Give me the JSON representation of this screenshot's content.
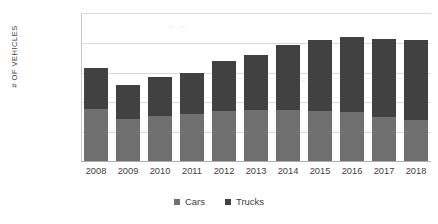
{
  "chart_data": {
    "type": "bar",
    "subtype": "stacked-vertical",
    "title": "",
    "xlabel": "",
    "ylabel": "# OF VEHICLES",
    "categories": [
      "2008",
      "2009",
      "2010",
      "2011",
      "2012",
      "2013",
      "2014",
      "2015",
      "2016",
      "2017",
      "2018"
    ],
    "series": [
      {
        "name": "Cars",
        "color": "#707070",
        "values": [
          8900000,
          7300000,
          7700000,
          8100000,
          8600000,
          8800000,
          8800000,
          8600000,
          8400000,
          7600000,
          7100000
        ]
      },
      {
        "name": "Trucks",
        "color": "#414141",
        "values": [
          6800000,
          5600000,
          6500000,
          6900000,
          8400000,
          9200000,
          10800000,
          11900000,
          12500000,
          13000000,
          13400000
        ]
      }
    ],
    "totals": [
      15700000,
      12900000,
      14200000,
      15000000,
      17000000,
      18000000,
      19600000,
      20500000,
      20900000,
      20600000,
      20500000
    ],
    "ylim": [
      0,
      25000000
    ],
    "ytick_values": [
      0,
      5000000,
      10000000,
      15000000,
      20000000,
      25000000
    ],
    "ytick_labels": [
      "-",
      "5,000,000",
      "10,000,000",
      "15,000,000",
      "20,000,000",
      "25,000,000"
    ],
    "grid": true,
    "legend_position": "bottom",
    "legend": [
      "Cars",
      "Trucks"
    ]
  },
  "axis": {
    "y_title": "# OF VEHICLES"
  },
  "legend": {
    "items": [
      {
        "label": "Cars",
        "color": "#707070"
      },
      {
        "label": "Trucks",
        "color": "#414141"
      }
    ]
  }
}
